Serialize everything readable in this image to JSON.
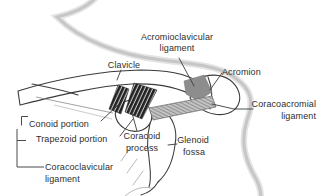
{
  "diagram": {
    "type": "anatomical line drawing",
    "background": "#ffffff"
  },
  "labels": {
    "acromioclavicular_ligament": {
      "line1": "Acromioclavicular",
      "line2": "ligament"
    },
    "clavicle": {
      "text": "Clavicle"
    },
    "acromion": {
      "text": "Acromion"
    },
    "coracoacromial_ligament": {
      "line1": "Coracoacromial",
      "line2": "ligament"
    },
    "conoid_portion": {
      "text": "Conoid portion"
    },
    "trapezoid_portion": {
      "text": "Trapezoid portion"
    },
    "coracoid_process": {
      "line1": "Coracoid",
      "line2": "process"
    },
    "glenoid_fossa": {
      "line1": "Glenoid",
      "line2": "fossa"
    },
    "coracoclavicular_ligament": {
      "line1": "Coracoclavicular",
      "line2": "ligament"
    }
  },
  "colors": {
    "outline": "#3b3b3b",
    "text": "#2e2e2e",
    "body_silhouette": "#c6c6c6",
    "dark_ligament_band": "#212121",
    "band_hatch": "#f5f5f5",
    "coracoacromial_band": "#c2c2c2",
    "coracoacromial_hatch": "#707070",
    "acromioclavicular_patch": "#8d8d8d"
  }
}
